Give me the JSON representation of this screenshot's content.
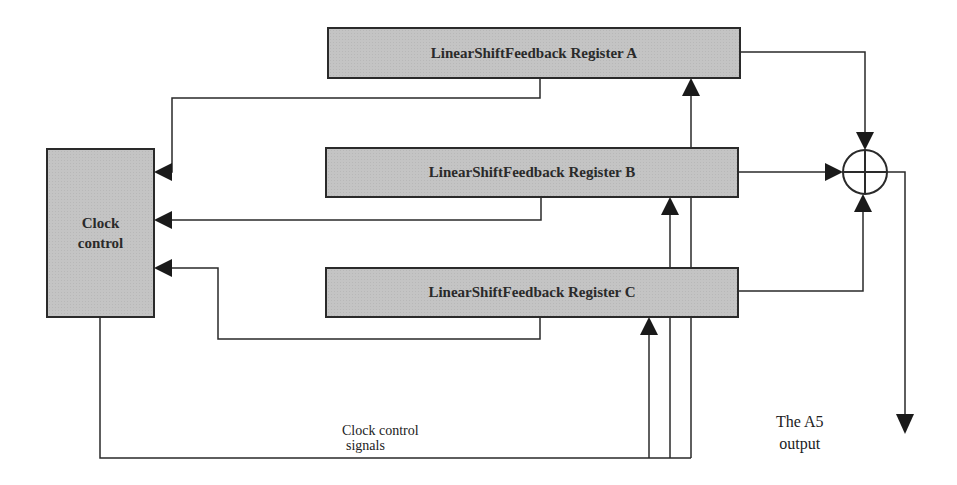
{
  "diagram": {
    "registers": [
      {
        "id": "A",
        "label": "LinearShiftFeedback Register A"
      },
      {
        "id": "B",
        "label": "LinearShiftFeedback Register B"
      },
      {
        "id": "C",
        "label": "LinearShiftFeedback Register C"
      }
    ],
    "clock_control": {
      "line1": "Clock",
      "line2": "control"
    },
    "signals_label": {
      "line1": "Clock control",
      "line2": "signals"
    },
    "output_label": {
      "line1": "The A5",
      "line2": "output"
    },
    "combiner": "xor-symbol",
    "colors": {
      "box_fill": "#c4c4c4",
      "line": "#2a2a2a",
      "background": "#ffffff"
    }
  }
}
